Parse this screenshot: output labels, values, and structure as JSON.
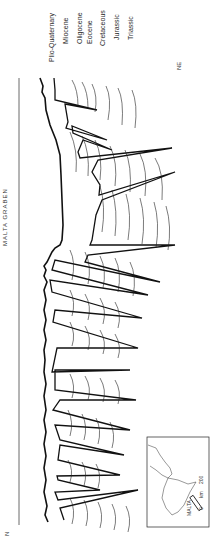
{
  "figure": {
    "title": "MALTA GRABEN",
    "orientation": "rotated -90deg (NE at top, SW/N at bottom)",
    "direction_labels": {
      "top": "NE",
      "bottom": "N"
    }
  },
  "legend": {
    "units": [
      {
        "label": "Plio-Quaternary",
        "x": 48
      },
      {
        "label": "Miocene",
        "x": 62
      },
      {
        "label": "Oligocene",
        "x": 76
      },
      {
        "label": "Eocene",
        "x": 86
      },
      {
        "label": "Cretaceous",
        "x": 99
      },
      {
        "label": "Jurassic",
        "x": 113
      },
      {
        "label": "Triassic",
        "x": 127
      }
    ]
  },
  "inset": {
    "label": "MALTA",
    "scale_min": "0",
    "scale_unit": "km",
    "scale_max": "200"
  },
  "colors": {
    "line": "#111111",
    "background": "#ffffff",
    "text": "#333333"
  }
}
